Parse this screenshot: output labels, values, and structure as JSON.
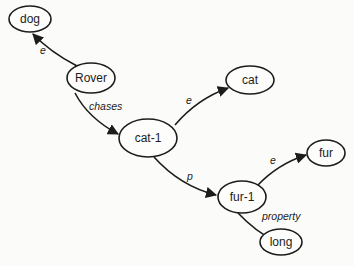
{
  "diagram": {
    "type": "semantic-network",
    "nodes": [
      {
        "id": "dog",
        "label": "dog"
      },
      {
        "id": "rover",
        "label": "Rover"
      },
      {
        "id": "cat",
        "label": "cat"
      },
      {
        "id": "cat1",
        "label": "cat-1"
      },
      {
        "id": "fur1",
        "label": "fur-1"
      },
      {
        "id": "fur",
        "label": "fur"
      },
      {
        "id": "long",
        "label": "long"
      }
    ],
    "edges": [
      {
        "from": "Rover",
        "to": "dog",
        "label": "e"
      },
      {
        "from": "Rover",
        "to": "cat-1",
        "label": "chases"
      },
      {
        "from": "cat-1",
        "to": "cat",
        "label": "e"
      },
      {
        "from": "cat-1",
        "to": "fur-1",
        "label": "p"
      },
      {
        "from": "fur-1",
        "to": "fur",
        "label": "e"
      },
      {
        "from": "fur-1",
        "to": "long",
        "label": "property"
      }
    ]
  }
}
